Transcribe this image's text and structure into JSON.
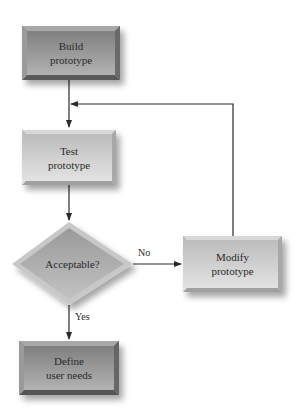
{
  "diagram": {
    "type": "flowchart",
    "nodes": [
      {
        "id": "build",
        "shape": "rectangle",
        "line1": "Build",
        "line2": "prototype",
        "fill": "#8e8e8e"
      },
      {
        "id": "test",
        "shape": "rectangle",
        "line1": "Test",
        "line2": "prototype",
        "fill": "#c4c4c4"
      },
      {
        "id": "acceptable",
        "shape": "diamond",
        "label": "Acceptable?",
        "fill": "#a9a9a9"
      },
      {
        "id": "modify",
        "shape": "rectangle",
        "line1": "Modify",
        "line2": "prototype",
        "fill": "#c4c4c4"
      },
      {
        "id": "define",
        "shape": "rectangle",
        "line1": "Define",
        "line2": "user needs",
        "fill": "#8a8a8a"
      }
    ],
    "edges": [
      {
        "from": "build",
        "to": "test",
        "label": ""
      },
      {
        "from": "test",
        "to": "acceptable",
        "label": ""
      },
      {
        "from": "acceptable",
        "to": "modify",
        "label": "No"
      },
      {
        "from": "acceptable",
        "to": "define",
        "label": "Yes"
      },
      {
        "from": "modify",
        "to": "test",
        "label": ""
      }
    ]
  },
  "labels": {
    "build_1": "Build",
    "build_2": "prototype",
    "test_1": "Test",
    "test_2": "prototype",
    "acceptable": "Acceptable?",
    "modify_1": "Modify",
    "modify_2": "prototype",
    "define_1": "Define",
    "define_2": "user needs",
    "no": "No",
    "yes": "Yes"
  }
}
